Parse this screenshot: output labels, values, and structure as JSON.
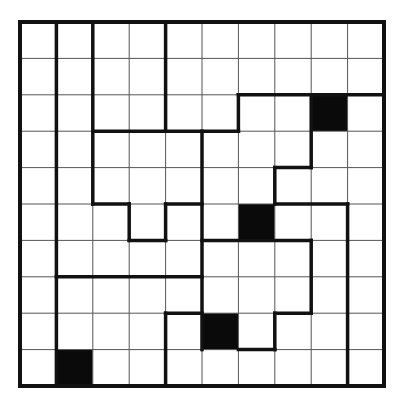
{
  "puzzle": {
    "type": "region-division grid puzzle",
    "rows": 10,
    "cols": 10,
    "origin": {
      "x": 20,
      "y": 22
    },
    "cell_size": 36.4,
    "colors": {
      "background": "#ffffff",
      "shaded_cell": "#0a0a0a",
      "grid_line": "#555555",
      "region_border": "#111111"
    },
    "shaded_cells": [
      {
        "col": 8,
        "row": 2
      },
      {
        "col": 6,
        "row": 5
      },
      {
        "col": 5,
        "row": 8
      },
      {
        "col": 1,
        "row": 9
      }
    ],
    "region_borders": {
      "vertical": [
        {
          "col": 1,
          "from_row": 0,
          "to_row": 10
        },
        {
          "col": 2,
          "from_row": 0,
          "to_row": 5
        },
        {
          "col": 4,
          "from_row": 0,
          "to_row": 3
        },
        {
          "col": 6,
          "from_row": 2,
          "to_row": 3
        },
        {
          "col": 8,
          "from_row": 2,
          "to_row": 4
        },
        {
          "col": 7,
          "from_row": 4,
          "to_row": 5
        },
        {
          "col": 9,
          "from_row": 5,
          "to_row": 10
        },
        {
          "col": 5,
          "from_row": 3,
          "to_row": 9
        },
        {
          "col": 3,
          "from_row": 5,
          "to_row": 6
        },
        {
          "col": 4,
          "from_row": 5,
          "to_row": 6
        },
        {
          "col": 8,
          "from_row": 6,
          "to_row": 8
        },
        {
          "col": 7,
          "from_row": 8,
          "to_row": 9
        },
        {
          "col": 4,
          "from_row": 8,
          "to_row": 10
        }
      ],
      "horizontal": [
        {
          "row": 3,
          "from_col": 2,
          "to_col": 6
        },
        {
          "row": 2,
          "from_col": 6,
          "to_col": 10
        },
        {
          "row": 4,
          "from_col": 7,
          "to_col": 8
        },
        {
          "row": 5,
          "from_col": 7,
          "to_col": 9
        },
        {
          "row": 5,
          "from_col": 2,
          "to_col": 3
        },
        {
          "row": 6,
          "from_col": 3,
          "to_col": 4
        },
        {
          "row": 5,
          "from_col": 4,
          "to_col": 5
        },
        {
          "row": 6,
          "from_col": 5,
          "to_col": 8
        },
        {
          "row": 8,
          "from_col": 7,
          "to_col": 8
        },
        {
          "row": 9,
          "from_col": 6,
          "to_col": 7
        },
        {
          "row": 7,
          "from_col": 1,
          "to_col": 5
        },
        {
          "row": 8,
          "from_col": 4,
          "to_col": 5
        }
      ]
    }
  }
}
